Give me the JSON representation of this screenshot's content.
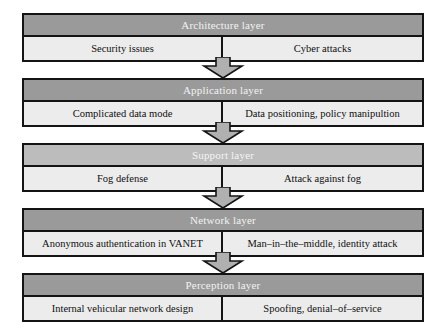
{
  "diagram": {
    "type": "layered-block-diagram",
    "title": "",
    "direction": "top-to-bottom",
    "arrow_icon": "down-block-arrow",
    "colors": {
      "header_dark": "#9a9a9a",
      "header_light": "#bcbcbc",
      "body": "#ececec",
      "border": "#141414",
      "arrow_fill": "#b0b0b0",
      "page_background": "#ffffff"
    },
    "layers": [
      {
        "header": "Architecture layer",
        "header_shade": "dark",
        "left_cell": "Security issues",
        "right_cell": "Cyber attacks"
      },
      {
        "header": "Application layer",
        "header_shade": "dark",
        "left_cell": "Complicated data mode",
        "right_cell": "Data positioning, policy manipultion"
      },
      {
        "header": "Support layer",
        "header_shade": "light",
        "left_cell": "Fog defense",
        "right_cell": "Attack against fog"
      },
      {
        "header": "Network layer",
        "header_shade": "dark",
        "left_cell": "Anonymous authentication in VANET",
        "right_cell": "Man–in–the–middle, identity attack"
      },
      {
        "header": "Perception layer",
        "header_shade": "dark",
        "left_cell": "Internal vehicular network design",
        "right_cell": "Spoofing, denial–of–service"
      }
    ],
    "arrows": [
      {
        "from": "Architecture layer",
        "to": "Application layer"
      },
      {
        "from": "Application layer",
        "to": "Support layer"
      },
      {
        "from": "Support layer",
        "to": "Network layer"
      },
      {
        "from": "Network layer",
        "to": "Perception layer"
      }
    ]
  }
}
